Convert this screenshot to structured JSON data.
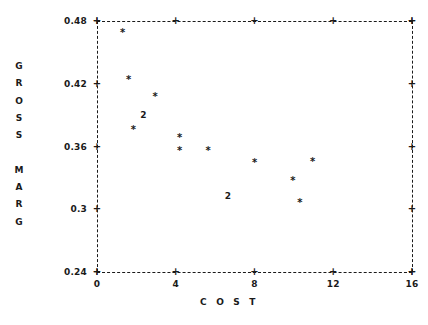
{
  "chart_data": {
    "type": "scatter",
    "title": "",
    "xlabel": "C O S T",
    "ylabel": "GROSS MARG",
    "ylabel_lines": [
      "G",
      "R",
      "O",
      "S",
      "S",
      "",
      "M",
      "A",
      "R",
      "G"
    ],
    "xlim": [
      0,
      16
    ],
    "ylim": [
      0.24,
      0.48
    ],
    "xticks": [
      0,
      4,
      8,
      12,
      16
    ],
    "xtick_labels": [
      "0",
      "4",
      "8",
      "12",
      "16"
    ],
    "yticks": [
      0.48,
      0.42,
      0.36,
      0.3,
      0.24
    ],
    "ytick_labels": [
      "0.48",
      "0.42",
      "0.36",
      "0.3",
      "0.24"
    ],
    "grid": false,
    "frame": "dashed-box",
    "marker": "*",
    "overlap_label": "2",
    "points": [
      {
        "x": 1.3,
        "y": 0.4665,
        "count": 1,
        "marker": "*"
      },
      {
        "x": 1.6,
        "y": 0.4215,
        "count": 1,
        "marker": "*"
      },
      {
        "x": 2.95,
        "y": 0.4055,
        "count": 1,
        "marker": "*"
      },
      {
        "x": 2.35,
        "y": 0.3895,
        "count": 2,
        "marker": "2"
      },
      {
        "x": 1.85,
        "y": 0.3735,
        "count": 1,
        "marker": "*"
      },
      {
        "x": 4.2,
        "y": 0.3665,
        "count": 1,
        "marker": "*"
      },
      {
        "x": 4.2,
        "y": 0.3535,
        "count": 1,
        "marker": "*"
      },
      {
        "x": 5.65,
        "y": 0.3535,
        "count": 1,
        "marker": "*"
      },
      {
        "x": 8.0,
        "y": 0.3425,
        "count": 1,
        "marker": "*"
      },
      {
        "x": 10.95,
        "y": 0.3435,
        "count": 1,
        "marker": "*"
      },
      {
        "x": 9.95,
        "y": 0.3255,
        "count": 1,
        "marker": "*"
      },
      {
        "x": 6.65,
        "y": 0.3115,
        "count": 2,
        "marker": "2"
      },
      {
        "x": 10.3,
        "y": 0.3045,
        "count": 1,
        "marker": "*"
      }
    ]
  },
  "annotations": {
    "tick_glyph": "+",
    "overlap_note": "2"
  }
}
